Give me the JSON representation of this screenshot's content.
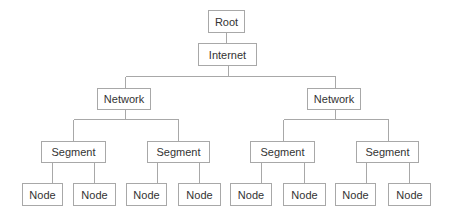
{
  "diagram": {
    "type": "tree",
    "colors": {
      "line": "#a8a8a8",
      "box_border": "#a8a8a8",
      "text": "#333333",
      "background": "#ffffff"
    },
    "root": {
      "label": "Root"
    },
    "internet": {
      "label": "Internet"
    },
    "networks": [
      {
        "label": "Network",
        "segments": [
          {
            "label": "Segment",
            "nodes": [
              {
                "label": "Node"
              },
              {
                "label": "Node"
              }
            ]
          },
          {
            "label": "Segment",
            "nodes": [
              {
                "label": "Node"
              },
              {
                "label": "Node"
              }
            ]
          }
        ]
      },
      {
        "label": "Network",
        "segments": [
          {
            "label": "Segment",
            "nodes": [
              {
                "label": "Node"
              },
              {
                "label": "Node"
              }
            ]
          },
          {
            "label": "Segment",
            "nodes": [
              {
                "label": "Node"
              },
              {
                "label": "Node"
              }
            ]
          }
        ]
      }
    ]
  }
}
